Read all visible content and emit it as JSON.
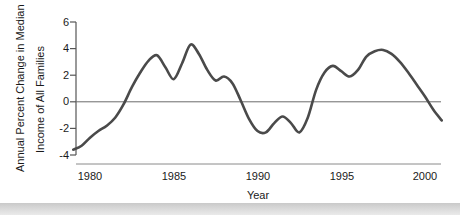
{
  "chart_data": {
    "type": "line",
    "title": "",
    "xlabel": "Year",
    "ylabel": "Annual Percent Change in Median Income of All Families",
    "ylabel_line1": "Annual Percent Change in Median",
    "ylabel_line2": "Income of All Families",
    "xlim": [
      1979,
      1981.5
    ],
    "ylim": [
      -4,
      6
    ],
    "xticks": [
      1980,
      1985,
      1990,
      1995,
      2000
    ],
    "xtick_labels": [
      "1980",
      "1985",
      "1990",
      "1995",
      "2000"
    ],
    "yticks": [
      -4,
      -2,
      0,
      2,
      4,
      6
    ],
    "ytick_labels": [
      "-4",
      "-2",
      "0",
      "2",
      "4",
      "6"
    ],
    "grid": false,
    "zero_line": true,
    "legend": "none",
    "line_color": "#4a4a4a",
    "axis_color": "#555555",
    "series": [
      {
        "name": "Annual Percent Change in Median Income of All Families",
        "x": [
          1979.0,
          1979.5,
          1980.0,
          1980.5,
          1981.0,
          1981.5,
          1982.0,
          1982.5,
          1983.0,
          1983.5,
          1984.0,
          1984.5,
          1985.0,
          1985.5,
          1986.0,
          1986.5,
          1987.0,
          1987.5,
          1988.0,
          1988.5,
          1989.0,
          1989.5,
          1990.0,
          1990.5,
          1991.0,
          1991.5,
          1992.0,
          1992.5,
          1993.0,
          1993.5,
          1994.0,
          1994.5,
          1995.0,
          1995.5,
          1996.0,
          1996.5,
          1997.0,
          1997.5,
          1998.0,
          1998.5,
          1999.0,
          1999.5,
          2000.0,
          2000.5,
          2001.0
        ],
        "y": [
          -3.6,
          -3.3,
          -2.7,
          -2.2,
          -1.8,
          -1.2,
          -0.2,
          1.1,
          2.2,
          3.1,
          3.5,
          2.6,
          1.7,
          2.9,
          4.3,
          3.6,
          2.4,
          1.6,
          1.9,
          1.4,
          0.1,
          -1.3,
          -2.2,
          -2.3,
          -1.6,
          -1.1,
          -1.6,
          -2.3,
          -1.2,
          0.9,
          2.2,
          2.7,
          2.3,
          1.9,
          2.4,
          3.4,
          3.8,
          3.9,
          3.6,
          3.0,
          2.2,
          1.3,
          0.4,
          -0.6,
          -1.4
        ]
      }
    ],
    "annotations": []
  },
  "axis": {
    "y_title_line1": "Annual Percent Change in Median",
    "y_title_line2": "Income of All Families",
    "x_title": "Year"
  }
}
